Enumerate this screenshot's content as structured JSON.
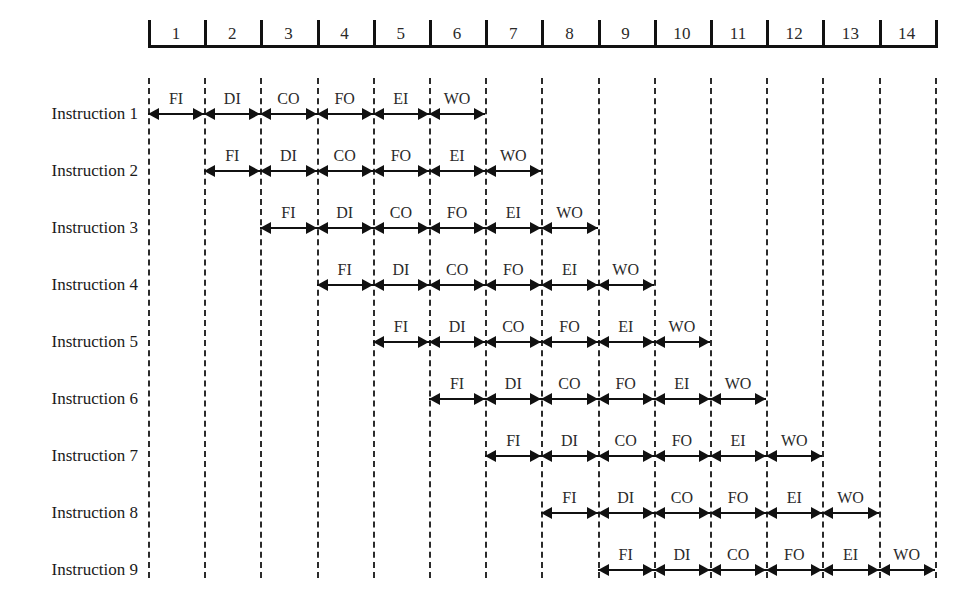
{
  "figure": {
    "background_color": "#ffffff",
    "line_color": "#111111",
    "grid_color": "#2b2b2b",
    "text_color": "#1a1a1a"
  },
  "time_axis": {
    "name": "time-ruler",
    "ticks": [
      "1",
      "2",
      "3",
      "4",
      "5",
      "6",
      "7",
      "8",
      "9",
      "10",
      "11",
      "12",
      "13",
      "14"
    ]
  },
  "stage_names": [
    "FI",
    "DI",
    "CO",
    "FO",
    "EI",
    "WO"
  ],
  "rows": [
    {
      "label": "Instruction 1",
      "start_cycle": 1,
      "stages": [
        "FI",
        "DI",
        "CO",
        "FO",
        "EI",
        "WO"
      ]
    },
    {
      "label": "Instruction 2",
      "start_cycle": 2,
      "stages": [
        "FI",
        "DI",
        "CO",
        "FO",
        "EI",
        "WO"
      ]
    },
    {
      "label": "Instruction 3",
      "start_cycle": 3,
      "stages": [
        "FI",
        "DI",
        "CO",
        "FO",
        "EI",
        "WO"
      ]
    },
    {
      "label": "Instruction 4",
      "start_cycle": 4,
      "stages": [
        "FI",
        "DI",
        "CO",
        "FO",
        "EI",
        "WO"
      ]
    },
    {
      "label": "Instruction 5",
      "start_cycle": 5,
      "stages": [
        "FI",
        "DI",
        "CO",
        "FO",
        "EI",
        "WO"
      ]
    },
    {
      "label": "Instruction 6",
      "start_cycle": 6,
      "stages": [
        "FI",
        "DI",
        "CO",
        "FO",
        "EI",
        "WO"
      ]
    },
    {
      "label": "Instruction 7",
      "start_cycle": 7,
      "stages": [
        "FI",
        "DI",
        "CO",
        "FO",
        "EI",
        "WO"
      ]
    },
    {
      "label": "Instruction 8",
      "start_cycle": 8,
      "stages": [
        "FI",
        "DI",
        "CO",
        "FO",
        "EI",
        "WO"
      ]
    },
    {
      "label": "Instruction 9",
      "start_cycle": 9,
      "stages": [
        "FI",
        "DI",
        "CO",
        "FO",
        "EI",
        "WO"
      ]
    }
  ],
  "chart_data": {
    "type": "table",
    "title": "",
    "xlabel": "",
    "ylabel": "",
    "categories": [
      "1",
      "2",
      "3",
      "4",
      "5",
      "6",
      "7",
      "8",
      "9",
      "10",
      "11",
      "12",
      "13",
      "14"
    ],
    "series": [
      {
        "name": "Instruction 1",
        "values": [
          "FI",
          "DI",
          "CO",
          "FO",
          "EI",
          "WO",
          "",
          "",
          "",
          "",
          "",
          "",
          "",
          ""
        ]
      },
      {
        "name": "Instruction 2",
        "values": [
          "",
          "FI",
          "DI",
          "CO",
          "FO",
          "EI",
          "WO",
          "",
          "",
          "",
          "",
          "",
          "",
          ""
        ]
      },
      {
        "name": "Instruction 3",
        "values": [
          "",
          "",
          "FI",
          "DI",
          "CO",
          "FO",
          "EI",
          "WO",
          "",
          "",
          "",
          "",
          "",
          ""
        ]
      },
      {
        "name": "Instruction 4",
        "values": [
          "",
          "",
          "",
          "FI",
          "DI",
          "CO",
          "FO",
          "EI",
          "WO",
          "",
          "",
          "",
          "",
          ""
        ]
      },
      {
        "name": "Instruction 5",
        "values": [
          "",
          "",
          "",
          "",
          "FI",
          "DI",
          "CO",
          "FO",
          "EI",
          "WO",
          "",
          "",
          "",
          ""
        ]
      },
      {
        "name": "Instruction 6",
        "values": [
          "",
          "",
          "",
          "",
          "",
          "FI",
          "DI",
          "CO",
          "FO",
          "EI",
          "WO",
          "",
          "",
          ""
        ]
      },
      {
        "name": "Instruction 7",
        "values": [
          "",
          "",
          "",
          "",
          "",
          "",
          "FI",
          "DI",
          "CO",
          "FO",
          "EI",
          "WO",
          "",
          ""
        ]
      },
      {
        "name": "Instruction 8",
        "values": [
          "",
          "",
          "",
          "",
          "",
          "",
          "",
          "FI",
          "DI",
          "CO",
          "FO",
          "EI",
          "WO",
          ""
        ]
      },
      {
        "name": "Instruction 9",
        "values": [
          "",
          "",
          "",
          "",
          "",
          "",
          "",
          "",
          "FI",
          "DI",
          "CO",
          "FO",
          "EI",
          "WO"
        ]
      }
    ]
  }
}
